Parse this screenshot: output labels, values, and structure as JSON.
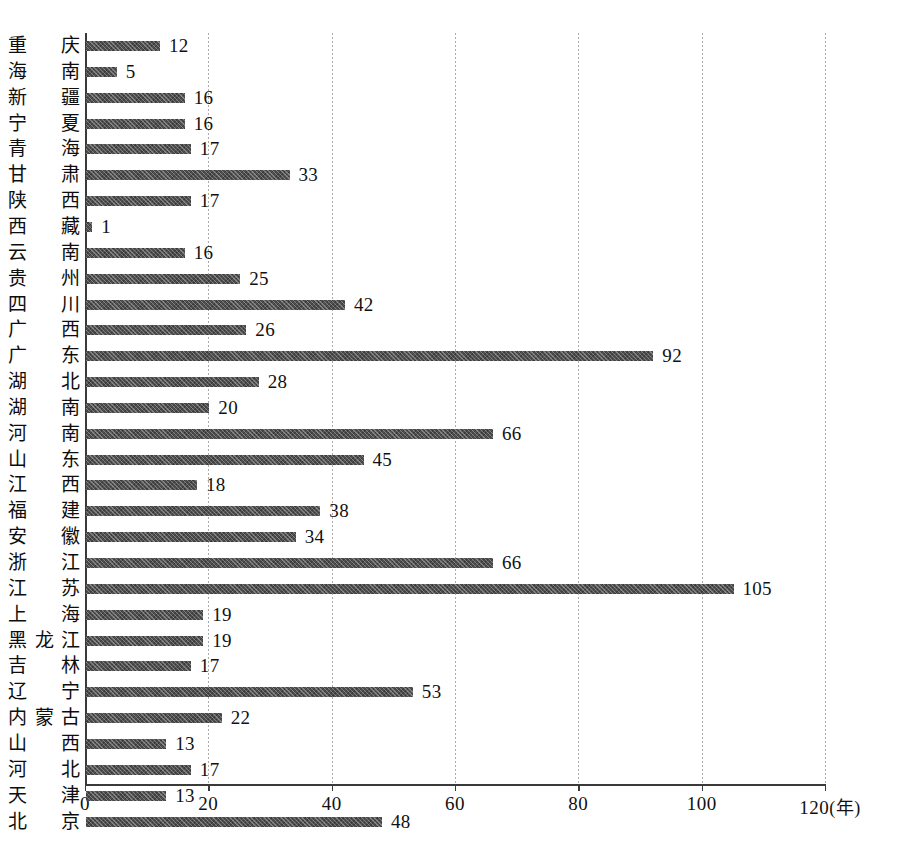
{
  "chart_data": {
    "type": "bar",
    "orientation": "horizontal",
    "title": "",
    "subtitle": "",
    "xlabel": "(年)",
    "ylabel": "",
    "xlim": [
      0,
      120
    ],
    "xticks": [
      0,
      20,
      40,
      60,
      80,
      100,
      120
    ],
    "xtick_labels": [
      "0",
      "20",
      "40",
      "60",
      "80",
      "100",
      "120"
    ],
    "x_unit_label": "(年)",
    "grid": true,
    "grid_axis": "x",
    "legend": null,
    "bar_color": "#4f4f4f",
    "show_value_labels": true,
    "categories": [
      "重庆",
      "海南",
      "新疆",
      "宁夏",
      "青海",
      "甘肃",
      "陕西",
      "西藏",
      "云南",
      "贵州",
      "四川",
      "广西",
      "广东",
      "湖北",
      "湖南",
      "河南",
      "山东",
      "江西",
      "福建",
      "安徽",
      "浙江",
      "江苏",
      "上海",
      "黑龙江",
      "吉林",
      "辽宁",
      "内蒙古",
      "山西",
      "河北",
      "天津",
      "北京"
    ],
    "values": [
      12,
      5,
      16,
      16,
      17,
      33,
      17,
      1,
      16,
      25,
      42,
      26,
      92,
      28,
      20,
      66,
      45,
      18,
      38,
      34,
      66,
      105,
      19,
      19,
      17,
      53,
      22,
      13,
      17,
      13,
      48
    ]
  }
}
